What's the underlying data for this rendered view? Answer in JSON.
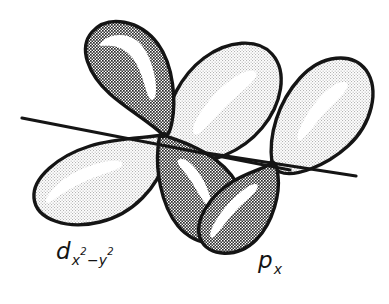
{
  "figure": {
    "background_color": "#ffffff",
    "outline_color": "#151515"
  },
  "labels": [
    {
      "name": "d-orbital-label",
      "base": "d",
      "sub_main": "x",
      "sub_exp_1": "2",
      "sub_mid": "−y",
      "sub_exp_2": "2",
      "full_text": "d x2-y2"
    },
    {
      "name": "p-orbital-label",
      "base": "p",
      "sub_main": "x",
      "full_text": "p x"
    }
  ],
  "orbitals": {
    "d_orbital": {
      "name": "d_x2-y2",
      "node_x": 163,
      "node_y": 135,
      "lobe_count": 4,
      "lobes": [
        {
          "name": "upper-left-lobe",
          "phase": "negative",
          "shade": "dark",
          "fill": "#8c8c8c"
        },
        {
          "name": "lower-left-lobe",
          "phase": "positive",
          "shade": "light",
          "fill": "#eaeaea"
        },
        {
          "name": "upper-right-lobe",
          "phase": "positive",
          "shade": "light",
          "fill": "#eaeaea"
        },
        {
          "name": "lower-right-lobe",
          "phase": "negative",
          "shade": "dark",
          "fill": "#8c8c8c"
        }
      ]
    },
    "p_orbital": {
      "name": "p_x",
      "node_x": 272,
      "node_y": 163,
      "lobe_count": 2,
      "lobes": [
        {
          "name": "p-upper-lobe",
          "phase": "positive",
          "shade": "light",
          "fill": "#eaeaea"
        },
        {
          "name": "p-lower-lobe",
          "phase": "negative",
          "shade": "dark",
          "fill": "#8c8c8c"
        }
      ]
    }
  },
  "axes": [
    {
      "name": "d-orbital-axis",
      "x1": 22,
      "y1": 118,
      "x2": 290,
      "y2": 170
    },
    {
      "name": "p-orbital-axis",
      "x1": 200,
      "y1": 152,
      "x2": 356,
      "y2": 176
    }
  ],
  "colors": {
    "dark_lobe": "#8c8c8c",
    "light_lobe": "#eaeaea",
    "outline": "#151515",
    "highlight": "#ffffff",
    "background": "#ffffff"
  }
}
